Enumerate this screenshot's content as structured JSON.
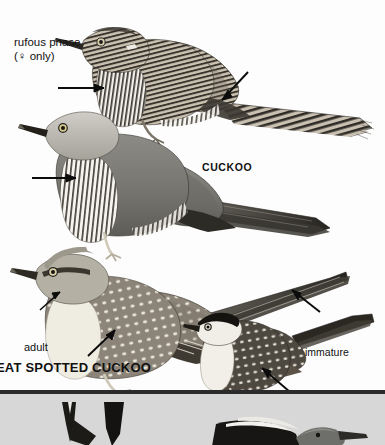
{
  "plate": {
    "kind": "field-guide-illustration-plate",
    "background_color": "#fdfdfd",
    "lower_strip_color": "#d7d7d7",
    "rule_color": "#2b2b2b",
    "ink_color": "#111111"
  },
  "labels": {
    "rufous_phase": "rufous phase\n(♀ only)",
    "cuckoo": "CUCKOO",
    "adult": "adult",
    "great_spotted_cuckoo": "EAT SPOTTED CUCKOO",
    "immature": "immature"
  },
  "birds": [
    {
      "name": "cuckoo-rufous-phase",
      "species_label": "CUCKOO",
      "plumage": "rufous phase",
      "sex": "♀ only",
      "features": "barred rufous upperparts, heavily barred underparts, long barred tail with white feather tips"
    },
    {
      "name": "cuckoo-grey-adult",
      "species_label": "CUCKOO",
      "plumage": "grey adult",
      "features": "plain grey head and upperparts, white barred underparts, long dark graduated tail, yellow eye-ring"
    },
    {
      "name": "great-spotted-cuckoo-adult",
      "species_label": "EAT SPOTTED CUCKOO",
      "plumage": "adult",
      "features": "grey crest, white-spotted brown wings, creamy underparts, very long graduated tail"
    },
    {
      "name": "great-spotted-cuckoo-immature",
      "species_label": "EAT SPOTTED CUCKOO",
      "plumage": "immature",
      "features": "blackish cap, white throat, white-spotted dark back, rufous primaries, long dark tail"
    }
  ],
  "annotations": [
    {
      "name": "arrow-rufous-underparts",
      "points_to": "barred underparts of rufous phase cuckoo",
      "direction": "right"
    },
    {
      "name": "arrow-rufous-wing",
      "points_to": "wing/rump of rufous phase cuckoo",
      "direction": "down-left"
    },
    {
      "name": "arrow-grey-underparts",
      "points_to": "barred underparts of grey adult cuckoo",
      "direction": "right"
    },
    {
      "name": "arrow-gsc-throat",
      "points_to": "throat of great spotted cuckoo adult",
      "direction": "down-left"
    },
    {
      "name": "arrow-gsc-flank",
      "points_to": "wing spots of great spotted cuckoo adult",
      "direction": "up-right"
    },
    {
      "name": "arrow-immature-tail",
      "points_to": "tail of great spotted cuckoo adult",
      "direction": "up-left"
    },
    {
      "name": "arrow-immature-wing",
      "points_to": "wing of immature great spotted cuckoo",
      "direction": "up-left"
    }
  ]
}
